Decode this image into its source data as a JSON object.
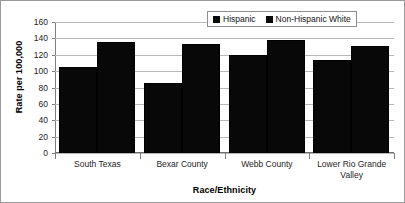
{
  "chart_data": {
    "type": "bar",
    "title": "",
    "subtitle": "",
    "xlabel": "Race/Ethnicity",
    "ylabel": "Rate per 100,000",
    "categories": [
      "South Texas",
      "Bexar County",
      "Webb County",
      "Lower Rio Grande Valley"
    ],
    "series": [
      {
        "name": "Hispanic",
        "values": [
          105,
          85,
          120,
          114
        ],
        "color": "#080808"
      },
      {
        "name": "Non-Hispanic White",
        "values": [
          135,
          133,
          138,
          131
        ],
        "color": "#080808"
      }
    ],
    "ylim": [
      0,
      160
    ],
    "ytick_step": 20,
    "yticks": [
      160,
      140,
      120,
      100,
      80,
      60,
      40,
      20,
      0
    ],
    "ytick_labels": [
      "160",
      "140",
      "120",
      "100",
      "80",
      "60",
      "40",
      "20",
      "0"
    ],
    "grid": true,
    "grid_axis": "y",
    "legend_position": "top-right",
    "legend": [
      "Hispanic",
      "Non-Hispanic White"
    ],
    "annotations": []
  },
  "axis": {
    "y_title": "Rate per 100,000",
    "x_title": "Race/Ethnicity"
  },
  "legend": {
    "entries": [
      {
        "label": "Hispanic",
        "swatch": "legend-swatch-icon"
      },
      {
        "label": "Non-Hispanic White",
        "swatch": "legend-swatch-icon"
      }
    ]
  },
  "x_labels": [
    {
      "line1": "South Texas",
      "line2": ""
    },
    {
      "line1": "Bexar County",
      "line2": ""
    },
    {
      "line1": "Webb County",
      "line2": ""
    },
    {
      "line1": "Lower Rio Grande",
      "line2": "Valley"
    }
  ],
  "colors": {
    "bar": "#080808",
    "grid": "#b9b9b9",
    "axis": "#7d7d7d",
    "frame": "#9a9a9a",
    "text": "#000000",
    "background": "#ffffff"
  }
}
